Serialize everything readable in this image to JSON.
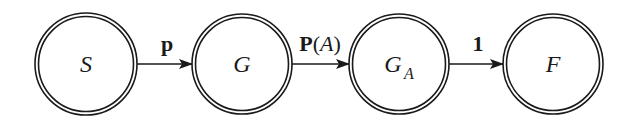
{
  "diagram": {
    "type": "state-transition",
    "nodes": [
      {
        "id": "S",
        "label": "S",
        "subscript": "",
        "cx": 86,
        "cy": 64
      },
      {
        "id": "G",
        "label": "G",
        "subscript": "",
        "cx": 242,
        "cy": 64
      },
      {
        "id": "GA",
        "label": "G",
        "subscript": "A",
        "cx": 399,
        "cy": 64
      },
      {
        "id": "F",
        "label": "F",
        "subscript": "",
        "cx": 553,
        "cy": 64
      }
    ],
    "edges": [
      {
        "from": "S",
        "to": "G",
        "label": "p"
      },
      {
        "from": "G",
        "to": "GA",
        "label_bold": "P",
        "label_open": "(",
        "label_italic": "A",
        "label_close": ")"
      },
      {
        "from": "GA",
        "to": "F",
        "label": "1"
      }
    ],
    "colors": {
      "stroke": "#1a1a1a",
      "background": "#ffffff"
    }
  }
}
